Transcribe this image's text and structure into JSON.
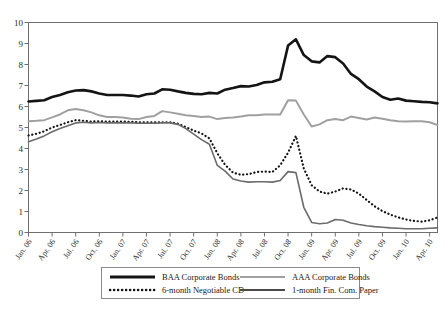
{
  "chart_data": {
    "type": "line",
    "title": "",
    "xlabel": "",
    "ylabel": "",
    "ylim": [
      0,
      10
    ],
    "ytick_labels": [
      "0",
      "1",
      "2",
      "3",
      "4",
      "5",
      "6",
      "7",
      "8",
      "9",
      "10"
    ],
    "ytick_values": [
      0,
      1,
      2,
      3,
      4,
      5,
      6,
      7,
      8,
      9,
      10
    ],
    "grid": false,
    "legend_position": "bottom",
    "x_tick_labels": [
      "Jan. 06",
      "Apr. 06",
      "Jul. 06",
      "Oct. 06",
      "Jan. 07",
      "Apr. 07",
      "Jul. 07",
      "Oct. 07",
      "Jan. 08",
      "Apr. 08",
      "Jul. 08",
      "Oct. 08",
      "Jan. 09",
      "Apr. 09",
      "Jul. 09",
      "Oct. 09",
      "Jan. 10",
      "Apr. 10"
    ],
    "x_months": [
      "Jan. 06",
      "Feb. 06",
      "Mar. 06",
      "Apr. 06",
      "May 06",
      "Jun. 06",
      "Jul. 06",
      "Aug. 06",
      "Sep. 06",
      "Oct. 06",
      "Nov. 06",
      "Dec. 06",
      "Jan. 07",
      "Feb. 07",
      "Mar. 07",
      "Apr. 07",
      "May 07",
      "Jun. 07",
      "Jul. 07",
      "Aug. 07",
      "Sep. 07",
      "Oct. 07",
      "Nov. 07",
      "Dec. 07",
      "Jan. 08",
      "Feb. 08",
      "Mar. 08",
      "Apr. 08",
      "May 08",
      "Jun. 08",
      "Jul. 08",
      "Aug. 08",
      "Sep. 08",
      "Oct. 08",
      "Nov. 08",
      "Dec. 08",
      "Jan. 09",
      "Feb. 09",
      "Mar. 09",
      "Apr. 09",
      "May 09",
      "Jun. 09",
      "Jul. 09",
      "Aug. 09",
      "Sep. 09",
      "Oct. 09",
      "Nov. 09",
      "Dec. 09",
      "Jan. 10",
      "Feb. 10",
      "Mar. 10",
      "Apr. 10",
      "May 10"
    ],
    "series": [
      {
        "name": "BAA Corporate Bonds",
        "style": "solid",
        "color": "#141414",
        "width": 2.6,
        "values": [
          6.24,
          6.27,
          6.3,
          6.45,
          6.55,
          6.68,
          6.76,
          6.78,
          6.72,
          6.62,
          6.55,
          6.55,
          6.55,
          6.52,
          6.48,
          6.58,
          6.62,
          6.82,
          6.8,
          6.72,
          6.65,
          6.6,
          6.58,
          6.65,
          6.62,
          6.8,
          6.88,
          6.97,
          6.95,
          7.02,
          7.15,
          7.18,
          7.3,
          8.9,
          9.2,
          8.45,
          8.15,
          8.1,
          8.4,
          8.35,
          8.05,
          7.55,
          7.3,
          6.95,
          6.72,
          6.45,
          6.32,
          6.38,
          6.28,
          6.25,
          6.22,
          6.2,
          6.15
        ]
      },
      {
        "name": "AAA Corporate Bonds",
        "style": "solid",
        "color": "#a0a0a0",
        "width": 2.0,
        "values": [
          5.3,
          5.32,
          5.35,
          5.48,
          5.62,
          5.82,
          5.88,
          5.82,
          5.72,
          5.58,
          5.5,
          5.5,
          5.48,
          5.42,
          5.4,
          5.5,
          5.55,
          5.78,
          5.72,
          5.65,
          5.58,
          5.55,
          5.5,
          5.52,
          5.4,
          5.45,
          5.48,
          5.52,
          5.58,
          5.58,
          5.62,
          5.62,
          5.62,
          6.3,
          6.28,
          5.62,
          5.05,
          5.15,
          5.35,
          5.4,
          5.35,
          5.52,
          5.45,
          5.38,
          5.48,
          5.42,
          5.35,
          5.3,
          5.28,
          5.3,
          5.3,
          5.25,
          5.12
        ]
      },
      {
        "name": "6-month Negotiable CD",
        "style": "dotted",
        "color": "#141414",
        "width": 2.2,
        "values": [
          4.62,
          4.7,
          4.82,
          5.0,
          5.12,
          5.25,
          5.35,
          5.32,
          5.28,
          5.3,
          5.28,
          5.28,
          5.28,
          5.27,
          5.25,
          5.25,
          5.25,
          5.25,
          5.25,
          5.18,
          5.02,
          4.85,
          4.72,
          4.48,
          3.78,
          3.22,
          2.85,
          2.75,
          2.78,
          2.88,
          2.9,
          2.88,
          3.2,
          3.8,
          4.6,
          3.05,
          2.25,
          1.95,
          1.85,
          1.95,
          2.1,
          2.05,
          1.85,
          1.55,
          1.25,
          1.02,
          0.85,
          0.72,
          0.62,
          0.55,
          0.52,
          0.58,
          0.72
        ]
      },
      {
        "name": "1-month Fin. Com. Paper",
        "style": "solid",
        "color": "#6b6b6b",
        "width": 1.6,
        "values": [
          4.32,
          4.45,
          4.6,
          4.8,
          4.95,
          5.08,
          5.22,
          5.25,
          5.22,
          5.24,
          5.22,
          5.22,
          5.22,
          5.22,
          5.2,
          5.2,
          5.2,
          5.22,
          5.22,
          5.15,
          4.95,
          4.68,
          4.42,
          4.2,
          3.2,
          2.92,
          2.55,
          2.45,
          2.4,
          2.42,
          2.42,
          2.4,
          2.48,
          2.9,
          2.85,
          1.2,
          0.48,
          0.42,
          0.45,
          0.62,
          0.58,
          0.45,
          0.38,
          0.32,
          0.28,
          0.25,
          0.22,
          0.2,
          0.18,
          0.18,
          0.18,
          0.2,
          0.22
        ]
      }
    ],
    "legend": [
      {
        "label": "BAA Corporate Bonds",
        "style": "solid",
        "color": "#141414",
        "width": 2.8
      },
      {
        "label": "AAA Corporate Bonds",
        "style": "solid",
        "color": "#a0a0a0",
        "width": 2.2
      },
      {
        "label": "6-month Negotiable CD",
        "style": "dotted",
        "color": "#141414",
        "width": 2.4
      },
      {
        "label": "1-month Fin. Com. Paper",
        "style": "solid",
        "color": "#4a4a4a",
        "width": 2.2
      }
    ]
  }
}
